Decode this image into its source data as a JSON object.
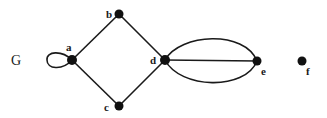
{
  "graph": {
    "name": "G",
    "nodes": [
      {
        "id": "a",
        "label": "a",
        "x": 72,
        "y": 60,
        "lx": 66,
        "ly": 51
      },
      {
        "id": "b",
        "label": "b",
        "x": 119,
        "y": 14,
        "lx": 107,
        "ly": 18
      },
      {
        "id": "c",
        "label": "c",
        "x": 119,
        "y": 106,
        "lx": 105,
        "ly": 111
      },
      {
        "id": "d",
        "label": "d",
        "x": 165,
        "y": 60,
        "lx": 151,
        "ly": 64
      },
      {
        "id": "e",
        "label": "e",
        "x": 257,
        "y": 61,
        "lx": 262,
        "ly": 75
      },
      {
        "id": "f",
        "label": "f",
        "x": 302,
        "y": 61,
        "lx": 307,
        "ly": 75
      }
    ],
    "edges": [
      {
        "from": "a",
        "to": "a",
        "type": "loop"
      },
      {
        "from": "a",
        "to": "b",
        "type": "line"
      },
      {
        "from": "a",
        "to": "c",
        "type": "line"
      },
      {
        "from": "b",
        "to": "d",
        "type": "line"
      },
      {
        "from": "c",
        "to": "d",
        "type": "line"
      },
      {
        "from": "d",
        "to": "e",
        "type": "line"
      },
      {
        "from": "d",
        "to": "e",
        "type": "arc-upper"
      },
      {
        "from": "d",
        "to": "e",
        "type": "arc-lower"
      }
    ]
  },
  "labels": {
    "graph_name": "G",
    "a": "a",
    "b": "b",
    "c": "c",
    "d": "d",
    "e": "e",
    "f": "f"
  }
}
